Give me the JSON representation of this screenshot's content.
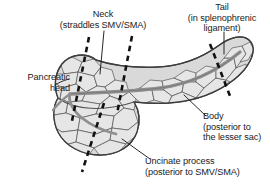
{
  "figure": {
    "colors": {
      "background": "#ffffff",
      "gland_fill": "#d9d9d9",
      "lobule_fill": "#e3e3e3",
      "outline": "#3d3d3d",
      "duct": "#9a9a9a",
      "duct_outline": "#6e6e6e",
      "dashed_line": "#111111",
      "leader_line": "#1b1b1b",
      "text": "#1b1b1b"
    }
  },
  "labels": {
    "pancreatic_head": {
      "line1": "Pancreatic",
      "line2": "head"
    },
    "neck": {
      "line1": "Neck",
      "line2": "(straddles SMV/SMA)"
    },
    "tail": {
      "line1": "Tail",
      "line2": "(in splenophrenic",
      "line3": "ligament)"
    },
    "body": {
      "line1": "Body",
      "line2": "(posterior to",
      "line3": "the lesser sac)"
    },
    "uncinate_process": {
      "line1": "Uncinate process",
      "line2": "(posterior to SMV/SMA)"
    }
  },
  "annotations": {
    "dashed_divider_count": 4,
    "leader_line_count": 5
  }
}
